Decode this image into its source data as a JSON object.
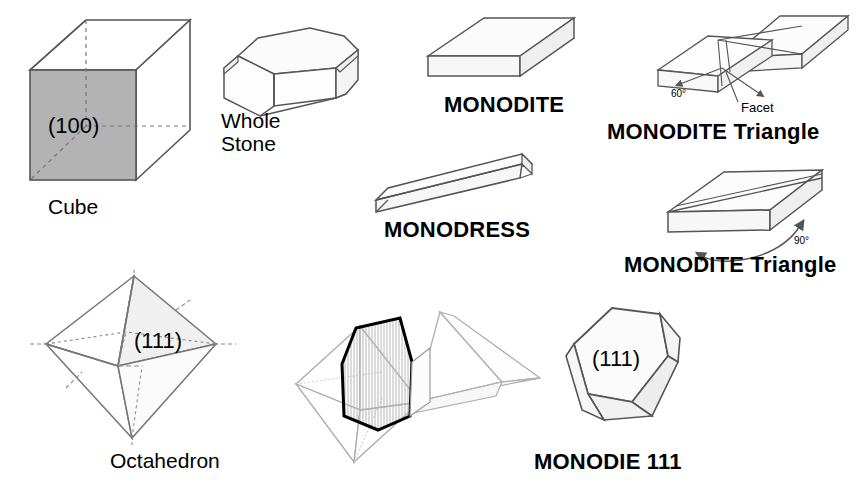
{
  "diagram": {
    "background_color": "#ffffff",
    "line_color": "#555555",
    "dark_line_color": "#000000",
    "shaded_face_color": "#b3b3b3",
    "light_face_color": "#f2f2f2",
    "hatch_face_color": "#d9d9d9"
  },
  "figures": {
    "cube": {
      "label": "Cube",
      "face_index": "(100)"
    },
    "whole_stone": {
      "label_line1": "Whole",
      "label_line2": "Stone"
    },
    "monodite": {
      "label": "MONODITE"
    },
    "monodite_triangle_60": {
      "label": "MONODITE Triangle",
      "angle": "60°",
      "callout": "Facet"
    },
    "monodress": {
      "label": "MONODRESS"
    },
    "monodite_triangle_90": {
      "label": "MONODITE Triangle",
      "angle": "90°"
    },
    "octahedron": {
      "label": "Octahedron",
      "face_index": "(111)"
    },
    "octahedron_pair": {
      "label": ""
    },
    "monodie_111": {
      "label": "MONODIE 111",
      "face_index": "(111)"
    }
  }
}
